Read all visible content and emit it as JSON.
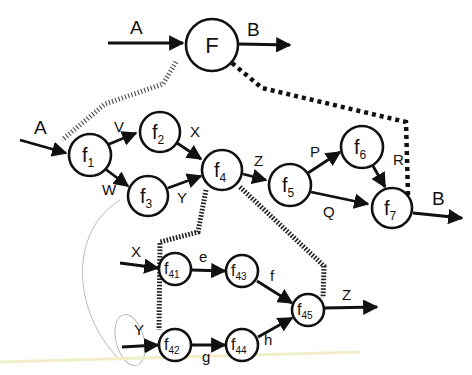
{
  "diagram": {
    "type": "hierarchical dataflow decomposition",
    "top_level": {
      "node": {
        "name": "F",
        "sub": ""
      },
      "input": {
        "label": "A"
      },
      "output": {
        "label": "B"
      }
    },
    "level1": {
      "nodes": [
        {
          "id": "f1",
          "name": "f",
          "sub": "1"
        },
        {
          "id": "f2",
          "name": "f",
          "sub": "2"
        },
        {
          "id": "f3",
          "name": "f",
          "sub": "3"
        },
        {
          "id": "f4",
          "name": "f",
          "sub": "4"
        },
        {
          "id": "f5",
          "name": "f",
          "sub": "5"
        },
        {
          "id": "f6",
          "name": "f",
          "sub": "6"
        },
        {
          "id": "f7",
          "name": "f",
          "sub": "7"
        }
      ],
      "edges": [
        {
          "from": "input",
          "to": "f1",
          "label": "A"
        },
        {
          "from": "f1",
          "to": "f2",
          "label": "V"
        },
        {
          "from": "f1",
          "to": "f3",
          "label": "W"
        },
        {
          "from": "f2",
          "to": "f4",
          "label": "X"
        },
        {
          "from": "f3",
          "to": "f4",
          "label": "Y"
        },
        {
          "from": "f4",
          "to": "f5",
          "label": "Z"
        },
        {
          "from": "f5",
          "to": "f6",
          "label": "P"
        },
        {
          "from": "f5",
          "to": "f7",
          "label": "Q"
        },
        {
          "from": "f6",
          "to": "f7",
          "label": "R"
        },
        {
          "from": "f7",
          "to": "output",
          "label": "B"
        }
      ]
    },
    "level2": {
      "expands": "f4",
      "nodes": [
        {
          "id": "f41",
          "name": "f",
          "sub": "41"
        },
        {
          "id": "f42",
          "name": "f",
          "sub": "42"
        },
        {
          "id": "f43",
          "name": "f",
          "sub": "43"
        },
        {
          "id": "f44",
          "name": "f",
          "sub": "44"
        },
        {
          "id": "f45",
          "name": "f",
          "sub": "45"
        }
      ],
      "edges": [
        {
          "from": "input",
          "to": "f41",
          "label": "X"
        },
        {
          "from": "input",
          "to": "f42",
          "label": "Y"
        },
        {
          "from": "f41",
          "to": "f43",
          "label": "e"
        },
        {
          "from": "f42",
          "to": "f44",
          "label": "g"
        },
        {
          "from": "f43",
          "to": "f45",
          "label": "f"
        },
        {
          "from": "f44",
          "to": "f45",
          "label": "h"
        },
        {
          "from": "f45",
          "to": "output",
          "label": "Z"
        }
      ]
    },
    "colors": {
      "ink": "#111111",
      "background": "#ffffff"
    }
  }
}
